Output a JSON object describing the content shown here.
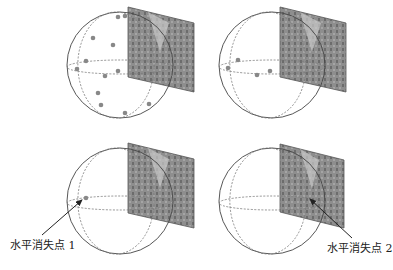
{
  "colors": {
    "sphere_stroke": "#444444",
    "dashed_stroke": "#777777",
    "point_fill": "#888888",
    "panel_fill": "#8a8a8a",
    "arrow": "#222222"
  },
  "panels": [
    {
      "id": "top-left",
      "sphere": {
        "cx": 120,
        "cy": 65,
        "r": 53
      },
      "image_plane": [
        [
          128,
          7
        ],
        [
          194,
          23
        ],
        [
          194,
          92
        ],
        [
          128,
          77
        ]
      ],
      "points": [
        [
          118,
          17
        ],
        [
          125,
          16
        ],
        [
          93,
          38
        ],
        [
          113,
          45
        ],
        [
          86,
          61
        ],
        [
          77,
          69
        ],
        [
          105,
          76
        ],
        [
          118,
          71
        ],
        [
          98,
          93
        ],
        [
          101,
          105
        ],
        [
          125,
          113
        ],
        [
          149,
          104
        ]
      ]
    },
    {
      "id": "top-right",
      "sphere": {
        "cx": 272,
        "cy": 65,
        "r": 53
      },
      "image_plane": [
        [
          280,
          7
        ],
        [
          346,
          23
        ],
        [
          346,
          92
        ],
        [
          280,
          77
        ]
      ],
      "points": [
        [
          238,
          60
        ],
        [
          228,
          68
        ],
        [
          257,
          75
        ],
        [
          270,
          71
        ]
      ]
    },
    {
      "id": "bottom-left",
      "sphere": {
        "cx": 120,
        "cy": 201,
        "r": 53
      },
      "image_plane": [
        [
          128,
          143
        ],
        [
          194,
          159
        ],
        [
          194,
          228
        ],
        [
          128,
          213
        ]
      ],
      "points": [
        [
          86,
          198
        ]
      ],
      "arrow": {
        "from": [
          42,
          235
        ],
        "to": [
          82,
          200
        ]
      }
    },
    {
      "id": "bottom-right",
      "sphere": {
        "cx": 272,
        "cy": 201,
        "r": 53
      },
      "image_plane": [
        [
          280,
          144
        ],
        [
          344,
          160
        ],
        [
          344,
          228
        ],
        [
          280,
          212
        ]
      ],
      "points": [],
      "arrow": {
        "from": [
          352,
          238
        ],
        "to": [
          310,
          199
        ]
      }
    }
  ],
  "labels": {
    "vanishing_point_1": "水平消失点 1",
    "vanishing_point_2": "水平消失点 2"
  }
}
